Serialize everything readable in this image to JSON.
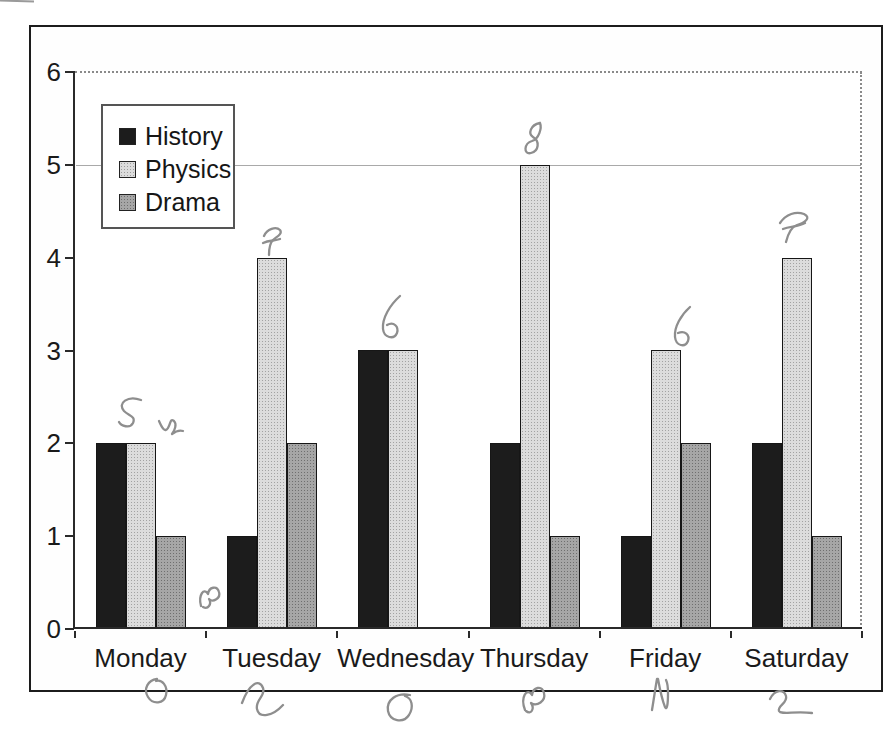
{
  "chart_data": {
    "type": "bar",
    "title": "",
    "xlabel": "",
    "ylabel": "",
    "categories": [
      "Monday",
      "Tuesday",
      "Wednesday",
      "Thursday",
      "Friday",
      "Saturday"
    ],
    "series": [
      {
        "name": "History",
        "color": "#1c1c1c",
        "values": [
          2,
          1,
          3,
          2,
          1,
          2
        ]
      },
      {
        "name": "Physics",
        "color": "#dcdcdc",
        "values": [
          2,
          4,
          3,
          5,
          3,
          4
        ]
      },
      {
        "name": "Drama",
        "color": "#a6a6a6",
        "values": [
          1,
          2,
          0,
          1,
          2,
          1
        ]
      }
    ],
    "ylim": [
      0,
      6
    ],
    "yticks": [
      "0",
      "1",
      "2",
      "3",
      "4",
      "5",
      "6"
    ],
    "legend_position": "inside top-left",
    "grid": "dotted line at y=6 and right edge; thin solid line at y=5"
  },
  "legend": {
    "items": [
      {
        "label": "History",
        "color": "#1c1c1c"
      },
      {
        "label": "Physics",
        "color": "#dcdcdc"
      },
      {
        "label": "Drama",
        "color": "#a6a6a6"
      }
    ]
  },
  "axes": {
    "y_tick_labels": [
      "6",
      "5",
      "4",
      "3",
      "2",
      "1",
      "0"
    ],
    "x_labels": [
      "Monday",
      "Tuesday",
      "Wednesday",
      "Thursday",
      "Friday",
      "Saturday"
    ]
  },
  "handwriting": {
    "color": "#8e8e8e",
    "marks": [
      {
        "value": "5",
        "location": "above Monday bars (total)"
      },
      {
        "value": "2",
        "location": "right of Monday Physics bar"
      },
      {
        "value": "7",
        "location": "above Tuesday Physics bar (total)"
      },
      {
        "value": "3",
        "location": "near baseline left of Tuesday group"
      },
      {
        "value": "6",
        "location": "above Wednesday bars (total)"
      },
      {
        "value": "8",
        "location": "above Thursday Physics bar (total)"
      },
      {
        "value": "6",
        "location": "above Friday Physics bar (total)"
      },
      {
        "value": "7",
        "location": "above Saturday Physics bar (total)"
      },
      {
        "value": "0",
        "location": "below Monday label"
      },
      {
        "value": "3",
        "location": "below Tuesday label"
      },
      {
        "value": "0",
        "location": "below Wednesday label"
      },
      {
        "value": "3",
        "location": "below Thursday label"
      },
      {
        "value": "2",
        "location": "below Friday label"
      },
      {
        "value": "2",
        "location": "below Saturday label"
      }
    ]
  }
}
